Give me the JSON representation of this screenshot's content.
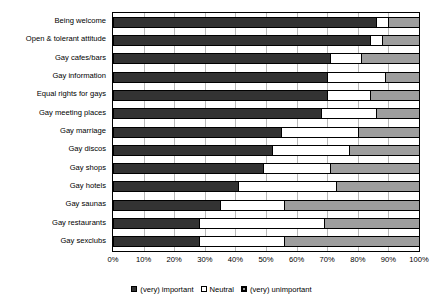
{
  "chart_data": {
    "type": "bar",
    "orientation": "horizontal",
    "stacked": true,
    "normalized": true,
    "title": "",
    "subtitle": "",
    "xlabel": "",
    "ylabel": "",
    "xlim": [
      0,
      100
    ],
    "xticks": [
      "0%",
      "10%",
      "20%",
      "30%",
      "40%",
      "50%",
      "60%",
      "70%",
      "80%",
      "90%",
      "100%"
    ],
    "grid": true,
    "legend_position": "bottom",
    "categories": [
      "Being welcome",
      "Open & tolerant attitude",
      "Gay cafes/bars",
      "Gay information",
      "Equal rights for gays",
      "Gay meeting places",
      "Gay marriage",
      "Gay discos",
      "Gay shops",
      "Gay hotels",
      "Gay saunas",
      "Gay restaurants",
      "Gay sexclubs"
    ],
    "series": [
      {
        "name": "(very) important",
        "color": "#333333",
        "values": [
          86,
          84,
          71,
          70,
          70,
          68,
          55,
          52,
          49,
          41,
          35,
          28,
          28
        ]
      },
      {
        "name": "Neutral",
        "color": "#ffffff",
        "values": [
          4,
          4,
          10,
          19,
          14,
          18,
          25,
          25,
          22,
          32,
          21,
          41,
          28
        ]
      },
      {
        "name": "(very) unimportant",
        "color": "#9e9e9e",
        "values": [
          10,
          12,
          19,
          11,
          16,
          14,
          20,
          23,
          29,
          27,
          44,
          31,
          44
        ]
      }
    ],
    "legend": [
      {
        "label": "(very) important",
        "swatch": "important"
      },
      {
        "label": "Neutral",
        "swatch": "neutral"
      },
      {
        "label": "(very) unimportant",
        "swatch": "unimportant"
      }
    ]
  }
}
